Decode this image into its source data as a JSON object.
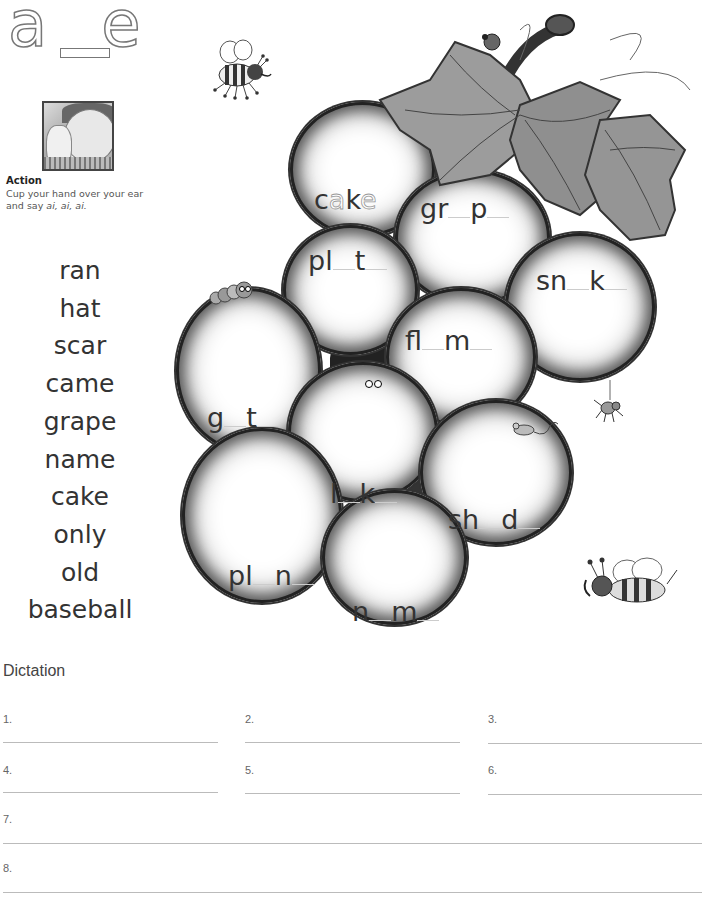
{
  "header": {
    "digraph": "a_e",
    "digraph_left": "a",
    "digraph_right": "e"
  },
  "action": {
    "title": "Action",
    "text_line1": "Cup your hand over your ear",
    "text_line2_prefix": "and say ",
    "text_line2_sound": "ai, ai, ai."
  },
  "word_list": [
    "ran",
    "hat",
    "scar",
    "came",
    "grape",
    "name",
    "cake",
    "only",
    "old",
    "baseball"
  ],
  "grapes": [
    {
      "name": "grape-cake",
      "prefix": "c",
      "missing1": "a",
      "middle": "k",
      "missing2": "e",
      "example": true
    },
    {
      "name": "grape-grape",
      "prefix": "gr",
      "middle": "p",
      "example": false
    },
    {
      "name": "grape-plate",
      "prefix": "pl",
      "middle": "t",
      "example": false
    },
    {
      "name": "grape-snake",
      "prefix": "sn",
      "middle": "k",
      "example": false
    },
    {
      "name": "grape-flame",
      "prefix": "fl",
      "middle": "m",
      "example": false
    },
    {
      "name": "grape-gate",
      "prefix": "g",
      "middle": "t",
      "example": false
    },
    {
      "name": "grape-lake",
      "prefix": "l",
      "middle": "k",
      "example": false
    },
    {
      "name": "grape-shade",
      "prefix": "sh",
      "middle": "d",
      "example": false
    },
    {
      "name": "grape-plane",
      "prefix": "pl",
      "middle": "n",
      "example": false
    },
    {
      "name": "grape-name",
      "prefix": "n",
      "middle": "m",
      "example": false
    }
  ],
  "dictation": {
    "title": "Dictation",
    "numbers": [
      "1.",
      "2.",
      "3.",
      "4.",
      "5.",
      "6.",
      "7.",
      "8."
    ]
  }
}
